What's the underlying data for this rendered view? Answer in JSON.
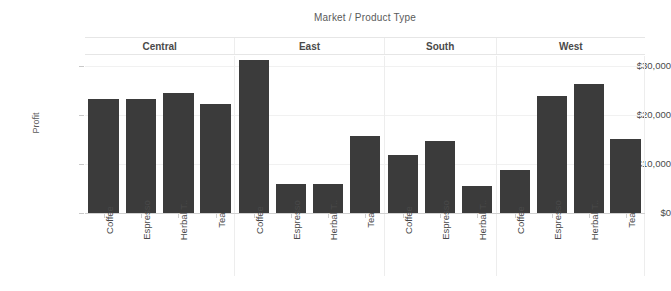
{
  "chart_data": {
    "type": "bar",
    "title": "Market  /  Product Type",
    "xlabel": "",
    "ylabel": "Profit",
    "ylim": [
      0,
      32000
    ],
    "grid": true,
    "legend": false,
    "bar_color": "#3b3b3b",
    "y_ticks": [
      {
        "value": 0,
        "label": "$0"
      },
      {
        "value": 10000,
        "label": "$10,000"
      },
      {
        "value": 20000,
        "label": "$20,000"
      },
      {
        "value": 30000,
        "label": "$30,000"
      }
    ],
    "panel_label": "Market",
    "category_label": "Product Type",
    "panels": [
      {
        "name": "Central",
        "categories": [
          "Coffee",
          "Espresso",
          "Herbal T..",
          "Tea"
        ],
        "values": [
          23200,
          23300,
          24500,
          22200
        ]
      },
      {
        "name": "East",
        "categories": [
          "Coffee",
          "Espresso",
          "Herbal T..",
          "Tea"
        ],
        "values": [
          31200,
          5900,
          6000,
          15600
        ]
      },
      {
        "name": "South",
        "categories": [
          "Coffee",
          "Espresso",
          "Herbal T.."
        ],
        "values": [
          11800,
          14700,
          5500
        ]
      },
      {
        "name": "West",
        "categories": [
          "Coffee",
          "Espresso",
          "Herbal T..",
          "Tea"
        ],
        "values": [
          8800,
          23800,
          26200,
          15000
        ]
      }
    ]
  }
}
